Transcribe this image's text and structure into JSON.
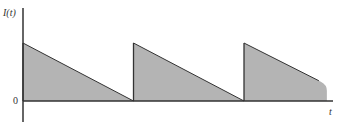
{
  "chart_data": {
    "type": "area",
    "title": "",
    "ylabel": "I(t)",
    "xlabel": "t",
    "y_tick_labels": [
      "0"
    ],
    "period": 1,
    "teeth": [
      {
        "t_start": 0,
        "t_end": 1,
        "value_start": 1,
        "value_end": 0
      },
      {
        "t_start": 1,
        "t_end": 2,
        "value_start": 1,
        "value_end": 0
      },
      {
        "t_start": 2,
        "t_end": 2.75,
        "value_start": 1,
        "value_end": 0.28
      }
    ],
    "xlim": [
      0,
      2.85
    ],
    "ylim": [
      -0.33,
      1.6
    ],
    "grid": false,
    "legend": "none",
    "colors": {
      "fill": "#b4b4b4",
      "line": "#333333"
    }
  }
}
